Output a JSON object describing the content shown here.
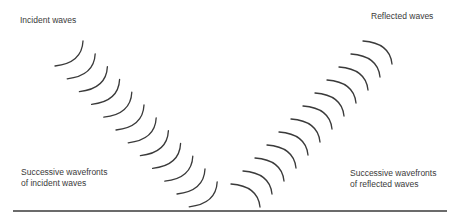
{
  "diagram": {
    "labels": {
      "incident_waves": "Incident waves",
      "reflected_waves": "Reflected waves",
      "incident_wavefronts_line1": "Successive wavefronts",
      "incident_wavefronts_line2": "of incident waves",
      "reflected_wavefronts_line1": "Successive wavefronts",
      "reflected_wavefronts_line2": "of reflected waves"
    },
    "surface": {
      "x1": 13,
      "x2": 447,
      "y": 211
    },
    "incident_arcs": {
      "count": 12,
      "start": [
        70,
        55
      ],
      "step": [
        12.2,
        12.8
      ]
    },
    "reflected_arcs": {
      "count": 12,
      "start": [
        378,
        52
      ],
      "step": [
        -12.0,
        13.0
      ]
    },
    "colors": {
      "stroke": "#3a3a3a",
      "text": "#3a3a3a",
      "background": "#ffffff"
    }
  }
}
